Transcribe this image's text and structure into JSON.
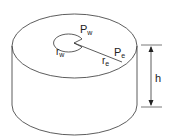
{
  "diagram": {
    "labels": {
      "wellbore_pressure_main": "P",
      "wellbore_pressure_sub": "w",
      "wellbore_radius_main": "r",
      "wellbore_radius_sub": "w",
      "external_pressure_main": "P",
      "external_pressure_sub": "e",
      "external_radius_main": "r",
      "external_radius_sub": "e",
      "height": "h"
    },
    "colors": {
      "stroke": "#333333",
      "background": "#ffffff"
    }
  }
}
